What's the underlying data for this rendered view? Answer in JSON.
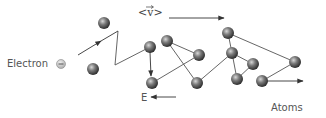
{
  "diagram": {
    "labels": {
      "electron": "Electron",
      "field": "E",
      "atoms": "Atoms",
      "drift_velocity": "<v>"
    },
    "colors": {
      "atom_dark": "#3a3a3a",
      "atom_light": "#bdbdbd",
      "line": "#555555",
      "electron_fill": "#c8c8c8"
    },
    "atoms": [
      {
        "x": 104,
        "y": 23
      },
      {
        "x": 93,
        "y": 69
      },
      {
        "x": 150,
        "y": 47
      },
      {
        "x": 167,
        "y": 41
      },
      {
        "x": 199,
        "y": 55
      },
      {
        "x": 152,
        "y": 83
      },
      {
        "x": 197,
        "y": 83
      },
      {
        "x": 228,
        "y": 33
      },
      {
        "x": 232,
        "y": 53
      },
      {
        "x": 253,
        "y": 64
      },
      {
        "x": 237,
        "y": 79
      },
      {
        "x": 262,
        "y": 81
      },
      {
        "x": 295,
        "y": 62
      }
    ],
    "path": [
      [
        78,
        55
      ],
      [
        118,
        31
      ],
      [
        115,
        65
      ],
      [
        150,
        47
      ],
      [
        152,
        76
      ]
    ]
  }
}
